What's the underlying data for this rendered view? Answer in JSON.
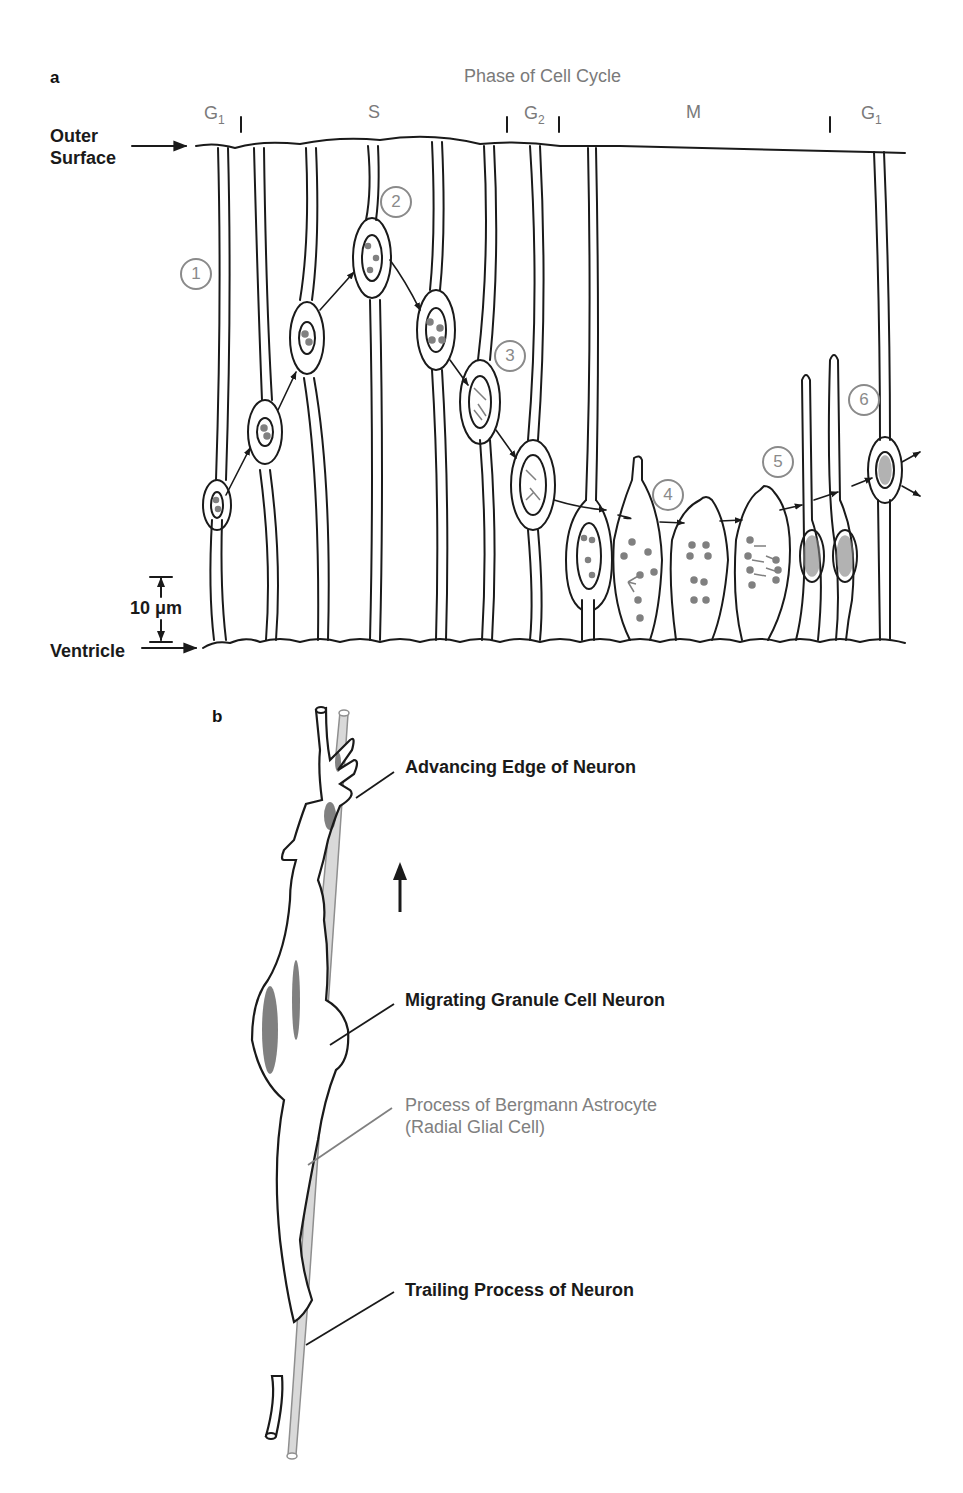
{
  "panel_a": {
    "letter": "a",
    "title": "Phase of Cell Cycle",
    "phases": [
      {
        "label": "G",
        "sub": "1"
      },
      {
        "label": "S",
        "sub": ""
      },
      {
        "label": "G",
        "sub": "2"
      },
      {
        "label": "M",
        "sub": ""
      },
      {
        "label": "G",
        "sub": "1"
      }
    ],
    "outer_surface_label_line1": "Outer",
    "outer_surface_label_line2": "Surface",
    "ventricle_label": "Ventricle",
    "scale_bar_label": "10 μm",
    "steps": [
      "1",
      "2",
      "3",
      "4",
      "5",
      "6"
    ]
  },
  "panel_b": {
    "letter": "b",
    "callouts": {
      "advancing_edge": "Advancing Edge of Neuron",
      "migrating_neuron": "Migrating Granule Cell Neuron",
      "glial_process_line1": "Process of Bergmann Astrocyte",
      "glial_process_line2": "(Radial Glial Cell)",
      "trailing_process": "Trailing Process of Neuron"
    },
    "direction_arrow": "up-arrow-icon"
  },
  "colors": {
    "ink": "#1a1a1a",
    "gray_label": "#7a7a7a",
    "glia_fill": "#d9d9d9",
    "chromosome": "#808080"
  }
}
